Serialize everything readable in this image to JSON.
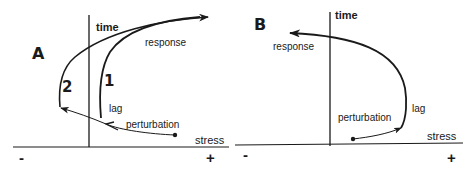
{
  "panels": {
    "a": {
      "letter": "A",
      "y_axis_label": "time",
      "x_axis_label": "stress",
      "x_minus": "-",
      "x_plus": "+",
      "labels": {
        "response": "response",
        "lag": "lag",
        "perturbation": "perturbation",
        "path1": "1",
        "path2": "2"
      }
    },
    "b": {
      "letter": "B",
      "y_axis_label": "time",
      "x_axis_label": "stress",
      "x_minus": "-",
      "x_plus": "+",
      "labels": {
        "response": "response",
        "lag": "lag",
        "perturbation": "perturbation"
      }
    }
  },
  "colors": {
    "ink": "#1a1a1a",
    "background": "#ffffff"
  }
}
